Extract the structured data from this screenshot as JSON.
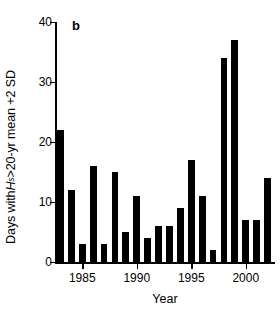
{
  "panel": {
    "letter": "b"
  },
  "axes": {
    "ylabel_prefix": "Days with ",
    "ylabel_symbol": "H",
    "ylabel_subscript": "s",
    "ylabel_suffix": ">20-yr mean +2 SD",
    "xlabel": "Year",
    "y_ticks": [
      0,
      10,
      20,
      30,
      40
    ],
    "x_ticks": [
      1985,
      1990,
      1995,
      2000
    ]
  },
  "chart_data": {
    "type": "bar",
    "title": "",
    "subtitle": "",
    "panel_label": "b",
    "xlabel": "Year",
    "ylabel": "Days with Hs>20-yr mean +2 SD",
    "categories": [
      1983,
      1984,
      1985,
      1986,
      1987,
      1988,
      1989,
      1990,
      1991,
      1992,
      1993,
      1994,
      1995,
      1996,
      1997,
      1998,
      1999,
      2000,
      2001,
      2002
    ],
    "values": [
      22,
      12,
      3,
      16,
      3,
      15,
      5,
      11,
      4,
      6,
      6,
      9,
      17,
      11,
      2,
      34,
      37,
      7,
      7,
      14
    ],
    "ylim": [
      0,
      40
    ],
    "xlim": [
      1982.5,
      2002.5
    ],
    "ytick_values": [
      0,
      10,
      20,
      30,
      40
    ],
    "xtick_values": [
      1985,
      1990,
      1995,
      2000
    ],
    "grid": false,
    "legend": "none",
    "bar_color": "#000000",
    "series": [
      {
        "name": "Days with Hs above 20-yr mean +2 SD",
        "values": [
          22,
          12,
          3,
          16,
          3,
          15,
          5,
          11,
          4,
          6,
          6,
          9,
          17,
          11,
          2,
          34,
          37,
          7,
          7,
          14
        ]
      }
    ]
  },
  "colors": {
    "bar": "#000000",
    "axis": "#000000",
    "background": "#ffffff"
  }
}
